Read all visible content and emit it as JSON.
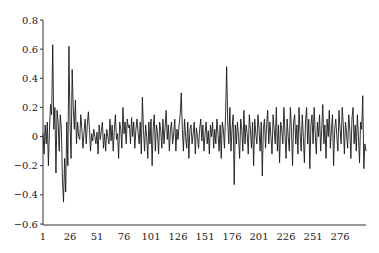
{
  "chart_data": {
    "type": "line",
    "title": "",
    "xlabel": "",
    "ylabel": "",
    "xlim": [
      1,
      300
    ],
    "ylim": [
      -0.6,
      0.8
    ],
    "grid": false,
    "legend": null,
    "x_ticks": [
      1,
      26,
      51,
      76,
      101,
      126,
      151,
      176,
      201,
      226,
      251,
      276
    ],
    "x_tick_labels": [
      "1",
      "26",
      "51",
      "76",
      "101",
      "126",
      "151",
      "176",
      "201",
      "226",
      "251",
      "276"
    ],
    "y_ticks": [
      -0.6,
      -0.4,
      -0.2,
      0,
      0.2,
      0.4,
      0.6,
      0.8
    ],
    "y_tick_labels": [
      "−0.6",
      "−0.4",
      "−0.2",
      "0",
      "0.2",
      "0.4",
      "0.6",
      "0.8"
    ],
    "series": [
      {
        "name": "series",
        "color": "#1a1a1a",
        "values": [
          0.02,
          -0.12,
          0.08,
          -0.05,
          0.1,
          -0.2,
          0.05,
          0.22,
          0.15,
          0.63,
          0.05,
          0.2,
          -0.25,
          0.18,
          0.1,
          -0.1,
          0.15,
          0.05,
          -0.3,
          -0.45,
          -0.15,
          -0.38,
          0.1,
          -0.2,
          0.62,
          0.1,
          -0.15,
          0.46,
          0.2,
          0.05,
          0.25,
          -0.05,
          0.1,
          0.0,
          -0.02,
          0.15,
          0.05,
          -0.08,
          0.03,
          0.12,
          -0.05,
          0.08,
          0.17,
          0.05,
          -0.1,
          0.02,
          -0.03,
          0.05,
          0.0,
          -0.05,
          0.03,
          -0.12,
          0.08,
          -0.02,
          0.04,
          0.1,
          -0.08,
          0.02,
          -0.1,
          0.05,
          0.0,
          -0.05,
          0.12,
          -0.03,
          0.08,
          -0.1,
          0.05,
          0.15,
          -0.02,
          0.02,
          -0.15,
          0.1,
          0.05,
          -0.08,
          0.2,
          0.02,
          0.1,
          -0.05,
          0.12,
          0.06,
          0.08,
          -0.05,
          0.13,
          0.0,
          0.1,
          -0.08,
          0.05,
          0.12,
          0.03,
          -0.05,
          0.1,
          -0.12,
          0.27,
          0.05,
          -0.1,
          0.08,
          0.0,
          -0.15,
          0.1,
          -0.05,
          0.12,
          -0.2,
          0.05,
          0.15,
          -0.1,
          0.08,
          0.02,
          -0.12,
          0.1,
          0.04,
          -0.08,
          0.12,
          -0.05,
          0.06,
          0.18,
          -0.02,
          0.08,
          -0.1,
          0.05,
          0.1,
          -0.05,
          0.02,
          0.12,
          -0.1,
          0.05,
          -0.02,
          0.08,
          0.15,
          0.3,
          0.05,
          -0.1,
          0.12,
          0.0,
          -0.08,
          0.1,
          -0.15,
          0.05,
          0.08,
          -0.05,
          0.02,
          0.1,
          -0.12,
          0.06,
          0.0,
          -0.08,
          0.05,
          0.12,
          -0.03,
          0.08,
          -0.1,
          0.02,
          0.1,
          -0.05,
          0.04,
          -0.12,
          0.08,
          0.0,
          0.1,
          -0.08,
          0.05,
          -0.05,
          0.12,
          0.02,
          -0.1,
          0.08,
          -0.15,
          0.1,
          0.05,
          -0.08,
          0.15,
          0.48,
          0.1,
          -0.05,
          0.2,
          -0.1,
          0.05,
          0.15,
          -0.33,
          0.08,
          -0.05,
          0.1,
          0.0,
          -0.15,
          0.12,
          0.05,
          -0.1,
          0.18,
          -0.05,
          0.08,
          0.02,
          -0.12,
          0.15,
          0.05,
          -0.08,
          0.1,
          -0.2,
          0.12,
          0.02,
          -0.05,
          0.15,
          0.05,
          -0.1,
          0.1,
          -0.27,
          0.05,
          0.12,
          -0.08,
          0.08,
          0.18,
          -0.05,
          0.1,
          0.0,
          -0.12,
          0.15,
          0.05,
          -0.05,
          0.2,
          -0.1,
          0.08,
          -0.18,
          0.1,
          0.05,
          -0.05,
          0.2,
          0.02,
          -0.15,
          0.12,
          0.0,
          -0.1,
          0.2,
          0.05,
          -0.2,
          0.1,
          0.15,
          -0.05,
          0.08,
          -0.12,
          0.2,
          0.02,
          -0.1,
          0.15,
          0.0,
          -0.18,
          0.1,
          0.2,
          -0.05,
          0.12,
          -0.22,
          0.08,
          0.15,
          -0.05,
          0.2,
          0.02,
          -0.12,
          0.1,
          0.0,
          0.15,
          -0.1,
          0.05,
          0.22,
          -0.05,
          0.08,
          -0.15,
          0.12,
          0.0,
          0.18,
          -0.08,
          0.05,
          0.15,
          -0.2,
          0.05,
          0.12,
          0.0,
          -0.1,
          0.18,
          0.05,
          -0.05,
          0.2,
          0.08,
          -0.12,
          0.1,
          0.02,
          -0.08,
          0.15,
          0.05,
          -0.15,
          0.12,
          0.2,
          -0.05,
          0.08,
          -0.1,
          0.15,
          0.0,
          -0.18,
          0.1,
          0.05,
          0.28,
          -0.22,
          -0.05,
          -0.1
        ]
      }
    ]
  }
}
